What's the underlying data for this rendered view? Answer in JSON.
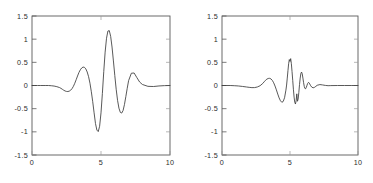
{
  "figure": {
    "background_color": "#ffffff",
    "axis_color": "#5a5a5a",
    "line_color": "#3b3b3b",
    "panel_count": 2
  },
  "chart_data": [
    {
      "type": "line",
      "title": "",
      "subtitle": "",
      "xlabel": "",
      "ylabel": "",
      "xlim": [
        0,
        10
      ],
      "ylim": [
        -1.5,
        1.5
      ],
      "xticks": [
        0,
        5,
        10
      ],
      "xticklabels": [
        "0",
        "5",
        "10"
      ],
      "yticks": [
        -1.5,
        -1,
        -0.5,
        0,
        0.5,
        1,
        1.5
      ],
      "yticklabels": [
        "-1.5",
        "-1",
        "-0.5",
        "0",
        "0.5",
        "1",
        "1.5"
      ],
      "grid": false,
      "legend": null,
      "annotations": [],
      "series": [
        {
          "name": "signal-left",
          "description": "Gaussian-modulated oscillatory wavelet pulse centered near x=4.9",
          "x": [
            0.0,
            0.2,
            0.4,
            0.6,
            0.8,
            1.0,
            1.2,
            1.4,
            1.6,
            1.8,
            2.0,
            2.1,
            2.2,
            2.3,
            2.4,
            2.5,
            2.6,
            2.7,
            2.8,
            2.9,
            3.0,
            3.1,
            3.2,
            3.3,
            3.4,
            3.5,
            3.6,
            3.7,
            3.8,
            3.9,
            4.0,
            4.1,
            4.2,
            4.3,
            4.4,
            4.5,
            4.6,
            4.7,
            4.8,
            4.9,
            5.0,
            5.1,
            5.2,
            5.3,
            5.4,
            5.5,
            5.6,
            5.7,
            5.8,
            5.9,
            6.0,
            6.1,
            6.2,
            6.3,
            6.4,
            6.5,
            6.6,
            6.7,
            6.8,
            6.9,
            7.0,
            7.2,
            7.4,
            7.6,
            7.8,
            8.0,
            8.4,
            8.8,
            9.2,
            9.6,
            10.0
          ],
          "y": [
            0.0,
            0.0,
            0.0,
            0.0,
            0.0,
            0.0,
            0.0,
            -0.005,
            -0.012,
            -0.025,
            -0.045,
            -0.062,
            -0.082,
            -0.102,
            -0.118,
            -0.128,
            -0.13,
            -0.122,
            -0.102,
            -0.068,
            -0.018,
            0.048,
            0.125,
            0.205,
            0.28,
            0.338,
            0.378,
            0.398,
            0.392,
            0.358,
            0.292,
            0.19,
            0.05,
            -0.135,
            -0.35,
            -0.59,
            -0.82,
            -0.962,
            -0.995,
            -0.88,
            -0.59,
            -0.17,
            0.3,
            0.72,
            1.02,
            1.175,
            1.185,
            1.06,
            0.83,
            0.53,
            0.215,
            -0.08,
            -0.32,
            -0.49,
            -0.58,
            -0.595,
            -0.54,
            -0.41,
            -0.24,
            -0.06,
            0.105,
            0.265,
            0.27,
            0.17,
            0.075,
            0.022,
            -0.018,
            -0.022,
            -0.01,
            -0.003,
            0.0
          ]
        }
      ]
    },
    {
      "type": "line",
      "title": "",
      "subtitle": "",
      "xlabel": "",
      "ylabel": "",
      "xlim": [
        0,
        10
      ],
      "ylim": [
        -1.5,
        1.5
      ],
      "xticks": [
        0,
        5,
        10
      ],
      "xticklabels": [
        "0",
        "5",
        "10"
      ],
      "yticks": [
        -1.5,
        -1,
        -0.5,
        0,
        0.5,
        1,
        1.5
      ],
      "yticklabels": [
        "-1.5",
        "-1",
        "-0.5",
        "0",
        "0.5",
        "1",
        "1.5"
      ],
      "grid": false,
      "legend": null,
      "annotations": [],
      "series": [
        {
          "name": "signal-right",
          "description": "Lower-amplitude wavelet pulse with high-frequency ripples after the main burst, centered near x=5",
          "x": [
            0.0,
            0.3,
            0.6,
            0.9,
            1.2,
            1.5,
            1.8,
            2.0,
            2.2,
            2.4,
            2.6,
            2.8,
            3.0,
            3.1,
            3.2,
            3.3,
            3.4,
            3.5,
            3.6,
            3.7,
            3.8,
            3.9,
            4.0,
            4.1,
            4.2,
            4.3,
            4.4,
            4.5,
            4.6,
            4.7,
            4.75,
            4.8,
            4.85,
            4.9,
            4.95,
            5.0,
            5.05,
            5.1,
            5.15,
            5.2,
            5.25,
            5.3,
            5.35,
            5.4,
            5.45,
            5.5,
            5.55,
            5.6,
            5.65,
            5.7,
            5.75,
            5.8,
            5.85,
            5.9,
            5.95,
            6.0,
            6.05,
            6.1,
            6.15,
            6.2,
            6.25,
            6.3,
            6.35,
            6.4,
            6.45,
            6.5,
            6.6,
            6.7,
            6.8,
            6.9,
            7.0,
            7.2,
            7.4,
            7.6,
            7.8,
            8.0,
            8.5,
            9.0,
            9.5,
            10.0
          ],
          "y": [
            0.0,
            0.0,
            0.0,
            -0.004,
            -0.01,
            -0.02,
            -0.032,
            -0.04,
            -0.046,
            -0.045,
            -0.032,
            -0.005,
            0.045,
            0.08,
            0.112,
            0.138,
            0.152,
            0.155,
            0.142,
            0.11,
            0.058,
            -0.012,
            -0.095,
            -0.185,
            -0.268,
            -0.33,
            -0.362,
            -0.345,
            -0.265,
            -0.1,
            0.01,
            0.16,
            0.32,
            0.47,
            0.56,
            0.52,
            0.58,
            0.47,
            0.3,
            0.11,
            -0.08,
            -0.25,
            -0.36,
            -0.4,
            -0.33,
            -0.18,
            -0.34,
            -0.29,
            -0.15,
            0.02,
            0.16,
            0.26,
            0.29,
            0.25,
            0.16,
            0.06,
            -0.02,
            -0.065,
            -0.07,
            -0.04,
            0.005,
            0.045,
            0.065,
            0.06,
            0.035,
            0.005,
            -0.035,
            -0.05,
            -0.04,
            -0.018,
            0.005,
            0.02,
            0.012,
            0.002,
            -0.004,
            -0.002,
            0.0,
            0.0,
            0.0,
            0.0
          ]
        }
      ]
    }
  ]
}
